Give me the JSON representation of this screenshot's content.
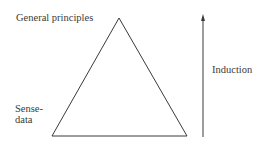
{
  "diagram": {
    "type": "triangle-with-arrow",
    "labels": {
      "apex": "General principles",
      "base_line1": "Sense-",
      "base_line2": "data",
      "arrow": "Induction"
    },
    "colors": {
      "stroke": "#3a3a3a",
      "text": "#3a3a3a",
      "background": "#ffffff"
    }
  }
}
